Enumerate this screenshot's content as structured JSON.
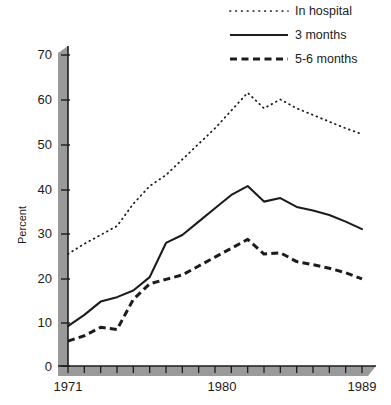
{
  "chart_data": {
    "type": "line",
    "title": "",
    "subtitle": "",
    "xlabel": "",
    "ylabel": "Percent",
    "xlim": [
      1971,
      1989
    ],
    "ylim": [
      0,
      70
    ],
    "grid": false,
    "legend_position": "top-right",
    "x": [
      1971,
      1972,
      1973,
      1974,
      1975,
      1976,
      1977,
      1978,
      1979,
      1980,
      1981,
      1982,
      1983,
      1984,
      1985,
      1986,
      1987,
      1988,
      1989
    ],
    "xticks": [
      1971,
      1972,
      1973,
      1974,
      1975,
      1976,
      1977,
      1978,
      1979,
      1980,
      1981,
      1982,
      1983,
      1984,
      1985,
      1986,
      1987,
      1988,
      1989
    ],
    "xtick_labels_shown": [
      "1971",
      "1980",
      "1989"
    ],
    "yticks": [
      0,
      10,
      20,
      30,
      40,
      50,
      60,
      70
    ],
    "ytick_labels": [
      "0",
      "10",
      "20",
      "30",
      "40",
      "50",
      "60",
      "70"
    ],
    "series": [
      {
        "name": "In hospital",
        "style": "dotted",
        "color": "#1c1c1c",
        "values": [
          25.2,
          27.5,
          29.5,
          31.5,
          36.5,
          40.5,
          43.0,
          46.5,
          50.0,
          53.5,
          57.5,
          61.5,
          58.0,
          60.0,
          58.0,
          56.5,
          55.0,
          53.5,
          52.2
        ]
      },
      {
        "name": "3 months",
        "style": "solid",
        "color": "#1c1c1c",
        "values": [
          9.0,
          11.5,
          14.5,
          15.5,
          17.0,
          20.0,
          27.7,
          29.5,
          32.5,
          35.5,
          38.5,
          40.5,
          37.0,
          37.8,
          35.8,
          35.0,
          34.0,
          32.5,
          30.8
        ]
      },
      {
        "name": "5-6 months",
        "style": "dashed",
        "color": "#1c1c1c",
        "values": [
          5.6,
          6.8,
          8.7,
          8.2,
          15.0,
          18.5,
          19.5,
          20.5,
          22.5,
          24.5,
          26.5,
          28.5,
          25.2,
          25.5,
          23.5,
          22.8,
          22.0,
          21.0,
          19.6
        ]
      }
    ]
  },
  "legend": {
    "items": [
      {
        "label": "In hospital",
        "style": "dotted"
      },
      {
        "label": "3 months",
        "style": "solid"
      },
      {
        "label": "5-6 months",
        "style": "dashed"
      }
    ]
  },
  "axes": {
    "y_title": "Percent",
    "y_labels": [
      "70",
      "60",
      "50",
      "40",
      "30",
      "20",
      "10",
      "0"
    ],
    "x_labels": [
      "1971",
      "1980",
      "1989"
    ]
  },
  "colors": {
    "ink": "#1c1c1c",
    "axis_band": "#9a9a9a",
    "background": "#ffffff"
  }
}
